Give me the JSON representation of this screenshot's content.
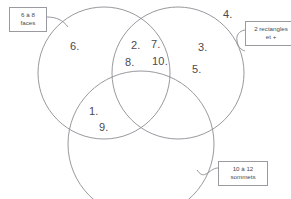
{
  "diagram": {
    "type": "venn-3-set",
    "background_color": "#ffffff",
    "stroke_color": "#8d8d93",
    "text_color": "#4a4a4e"
  },
  "sets": [
    {
      "id": "faces",
      "label": "6 à 8 faces",
      "label_line_1": "6 à 8",
      "label_line_2": "faces",
      "position": "top-left"
    },
    {
      "id": "rectangles",
      "label": "2 rectangles et +",
      "label_line_1": "2 rectangles",
      "label_line_2": "et +",
      "position": "top-right"
    },
    {
      "id": "sommets",
      "label": "10 à 12 sommets",
      "label_line_1": "10 à 12",
      "label_line_2": "sommets",
      "position": "bottom-right"
    }
  ],
  "items": [
    {
      "id": "item-6",
      "text": "6.",
      "region": "faces-only",
      "x": 70,
      "y": 41
    },
    {
      "id": "item-2",
      "text": "2.",
      "region": "faces-rectangles",
      "x": 131,
      "y": 40
    },
    {
      "id": "item-7",
      "text": "7.",
      "region": "faces-rectangles",
      "x": 151,
      "y": 39
    },
    {
      "id": "item-8",
      "text": "8.",
      "region": "faces-rectangles",
      "x": 125,
      "y": 57
    },
    {
      "id": "item-10",
      "text": "10.",
      "region": "faces-rectangles",
      "x": 152,
      "y": 56
    },
    {
      "id": "item-3",
      "text": "3.",
      "region": "rectangles-only",
      "x": 198,
      "y": 42
    },
    {
      "id": "item-5",
      "text": "5.",
      "region": "rectangles-only",
      "x": 192,
      "y": 64
    },
    {
      "id": "item-1",
      "text": "1.",
      "region": "faces-sommets",
      "x": 89,
      "y": 106
    },
    {
      "id": "item-9",
      "text": "9.",
      "region": "faces-sommets",
      "x": 99,
      "y": 122
    },
    {
      "id": "item-4",
      "text": "4.",
      "region": "outside-all",
      "x": 223,
      "y": 9
    }
  ]
}
